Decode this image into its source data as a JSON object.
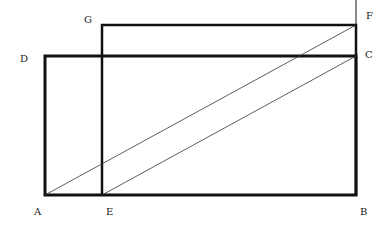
{
  "diagram": {
    "type": "geometric-figure",
    "colors": {
      "line": "#111111",
      "label": "#222222",
      "background": "#ffffff"
    },
    "points": {
      "A": {
        "label": "A",
        "x": 45,
        "y": 195
      },
      "E": {
        "label": "E",
        "x": 102,
        "y": 195
      },
      "B": {
        "label": "B",
        "x": 356,
        "y": 195
      },
      "D": {
        "label": "D",
        "x": 45,
        "y": 56
      },
      "C": {
        "label": "C",
        "x": 356,
        "y": 56
      },
      "G": {
        "label": "G",
        "x": 102,
        "y": 25
      },
      "F": {
        "label": "F",
        "x": 356,
        "y": 25
      }
    },
    "shapes": [
      {
        "name": "rectangle-ABCD",
        "vertices": [
          "A",
          "B",
          "C",
          "D"
        ],
        "stroke": "thick"
      },
      {
        "name": "rectangle-EBFG",
        "vertices": [
          "E",
          "B",
          "F",
          "G"
        ],
        "stroke": "thick"
      }
    ],
    "lines": [
      {
        "name": "diagonal-AF",
        "from": "A",
        "to": "F",
        "stroke": "thin"
      },
      {
        "name": "diagonal-EC",
        "from": "E",
        "to": "C",
        "stroke": "thin"
      },
      {
        "name": "extension-BF-up",
        "from": "F",
        "to": "top",
        "stroke": "thin"
      }
    ],
    "labels": {
      "A": "A",
      "E": "E",
      "B": "B",
      "D": "D",
      "C": "C",
      "G": "G",
      "F": "F"
    }
  }
}
